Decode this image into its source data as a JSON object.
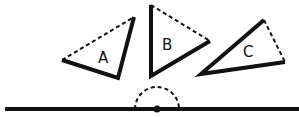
{
  "diagram": {
    "title": "",
    "triangles": [
      {
        "label": "A",
        "vertices": [
          [
            62,
            60
          ],
          [
            134,
            17
          ],
          [
            118,
            78
          ]
        ],
        "dashed_edge": [
          0,
          1
        ],
        "label_pos": [
          104,
          62
        ]
      },
      {
        "label": "B",
        "vertices": [
          [
            151,
            5
          ],
          [
            151,
            76
          ],
          [
            210,
            41
          ]
        ],
        "dashed_edge": [
          0,
          2
        ],
        "label_pos": [
          168,
          51
        ]
      },
      {
        "label": "C",
        "vertices": [
          [
            264,
            20
          ],
          [
            201,
            74
          ],
          [
            285,
            62
          ]
        ],
        "dashed_edge": [
          0,
          2
        ],
        "label_pos": [
          241,
          54
        ]
      }
    ],
    "baseline": {
      "y": 109,
      "x_start": 5,
      "x_end": 299
    },
    "point": {
      "x": 157,
      "y": 109
    },
    "semicircle": {
      "cx": 157,
      "cy": 109,
      "r": 22,
      "style": "dashed"
    },
    "colors": {
      "stroke": "#111111",
      "background": "#ffffff"
    }
  }
}
